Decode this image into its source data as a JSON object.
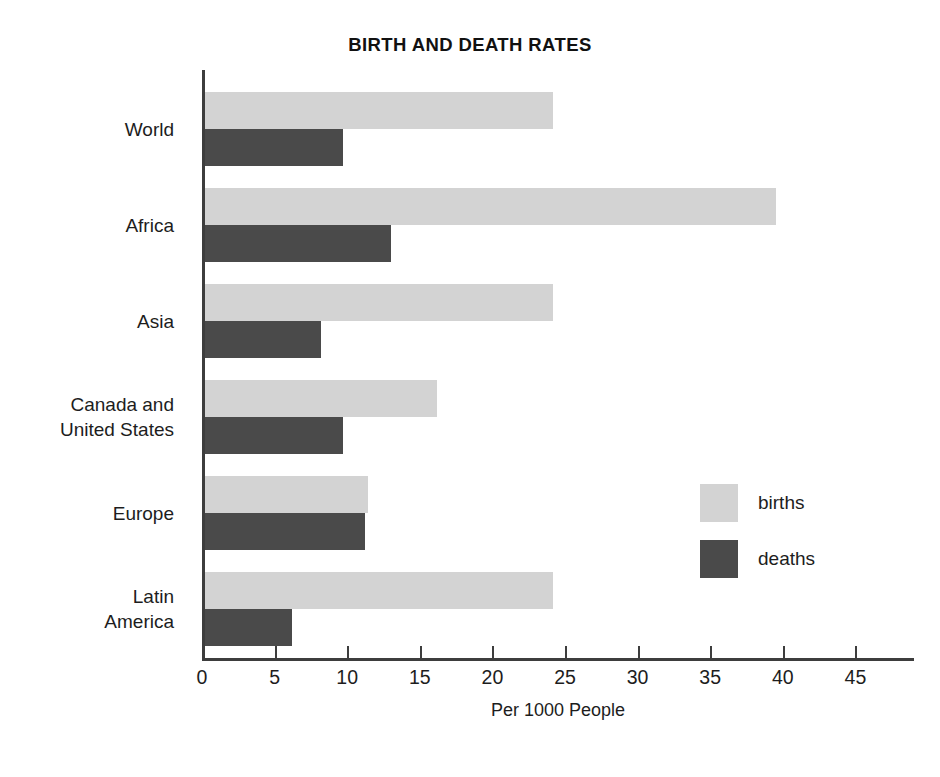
{
  "chart_data": {
    "type": "bar",
    "orientation": "horizontal",
    "title": "BIRTH AND DEATH RATES",
    "xlabel": "Per 1000 People",
    "ylabel": "",
    "categories": [
      "World",
      "Africa",
      "Asia",
      "Canada and\nUnited States",
      "Europe",
      "Latin\nAmerica"
    ],
    "category_lines": [
      [
        "World"
      ],
      [
        "Africa"
      ],
      [
        "Asia"
      ],
      [
        "Canada and",
        "United States"
      ],
      [
        "Europe"
      ],
      [
        "Latin",
        "America"
      ]
    ],
    "series": [
      {
        "name": "births",
        "color": "#d3d3d3",
        "values": [
          24,
          39.3,
          24,
          16,
          11.2,
          24
        ]
      },
      {
        "name": "deaths",
        "color": "#4a4a4a",
        "values": [
          9.5,
          12.8,
          8,
          9.5,
          11,
          6
        ]
      }
    ],
    "xlim": [
      0,
      45
    ],
    "xticks": [
      0,
      5,
      10,
      15,
      20,
      25,
      30,
      35,
      40,
      45
    ],
    "xtick_labels": [
      "0",
      "5",
      "10",
      "15",
      "20",
      "25",
      "30",
      "35",
      "40",
      "45"
    ],
    "grid": false,
    "legend_position": "middle-right",
    "legend": [
      "births",
      "deaths"
    ]
  },
  "colors": {
    "births": "#d3d3d3",
    "deaths": "#4a4a4a",
    "axis": "#3d3d3d",
    "text": "#1d1d1d",
    "background": "#ffffff"
  }
}
